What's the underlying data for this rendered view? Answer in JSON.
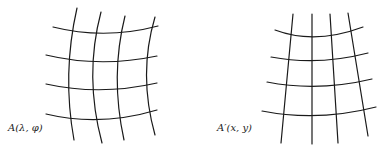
{
  "diagram": {
    "left_panel": {
      "label": "A(λ,  φ)",
      "description": "Graticule on the ellipsoid (curved meridians and parallels)"
    },
    "right_panel": {
      "label": "A′(x,  y)",
      "description": "Projected graticule on the plane"
    },
    "colors": {
      "line": "#1a1a1a",
      "background": "#ffffff"
    }
  }
}
